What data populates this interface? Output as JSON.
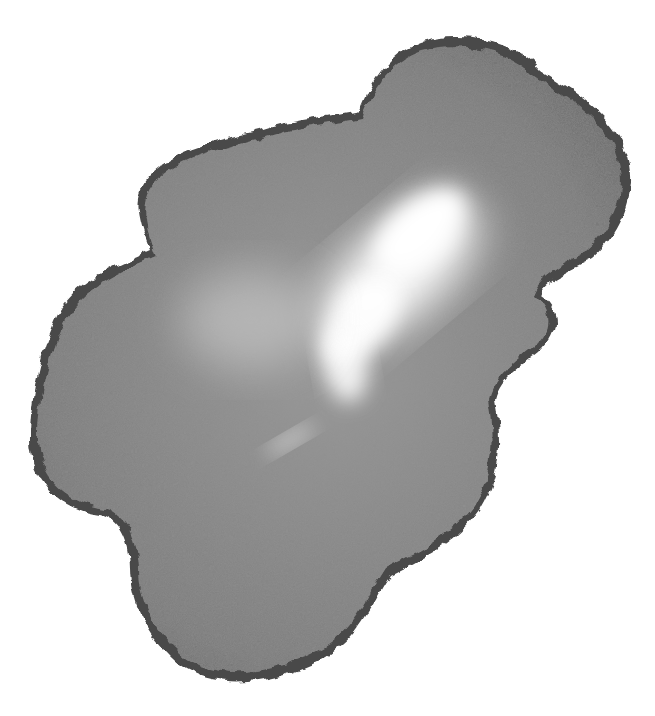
{
  "image": {
    "subject": "gray watercolor ink blot",
    "background_color": "#ffffff",
    "blot_color": "#7a7a7a",
    "edge_color": "#3c3c3c",
    "highlight_color": "#ffffff"
  }
}
